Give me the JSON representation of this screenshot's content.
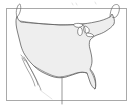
{
  "image": {
    "kind": "map-thumbnail",
    "subject": "Contiguous United States outline map",
    "width_px": 134,
    "height_px": 108,
    "background_color": "#ffffff",
    "has_labels": false,
    "has_legend": false,
    "has_title": false
  },
  "frame": {
    "name": "map border frame",
    "border_color": "#a9a9a9",
    "border_width_px": 1,
    "fill_color": "#ffffff",
    "left_px": 6,
    "top_px": 8,
    "width_px": 121,
    "height_px": 93
  },
  "map": {
    "projection_look": "equirectangular-like",
    "land_fill_color": "#eeeeee",
    "coastline_color": "#4a4a4a",
    "coastline_width_px": 0.7,
    "water_fill_color": "#ffffff",
    "features": [
      {
        "name": "contiguous-us-landmass",
        "type": "polygon",
        "fill": "#eeeeee"
      },
      {
        "name": "northern-border-line",
        "type": "line",
        "note": "straight US-Canada 49th parallel border"
      },
      {
        "name": "great-lakes",
        "type": "water-bodies",
        "fill": "#ffffff"
      },
      {
        "name": "florida-peninsula",
        "type": "polygon-extension"
      },
      {
        "name": "gulf-coast",
        "type": "coastline"
      },
      {
        "name": "baja-california-peninsula",
        "type": "line"
      },
      {
        "name": "maine-northeast-tip",
        "type": "polygon-extension"
      },
      {
        "name": "pacific-northwest-tip",
        "type": "polygon-extension"
      },
      {
        "name": "texas-southern-line",
        "type": "line"
      }
    ],
    "overhangs": [
      {
        "name": "top-left-overhang",
        "description": "Pacific Northwest outline extends above frame"
      },
      {
        "name": "top-right-overhang",
        "description": "Northeast / Maine outline extends above frame"
      },
      {
        "name": "bottom-center-overhang",
        "description": "short line below Texas extends past frame"
      }
    ]
  },
  "annotations": {
    "text_items": [],
    "note": "No visible text, labels, legend, tick marks or titles in this thumbnail."
  }
}
